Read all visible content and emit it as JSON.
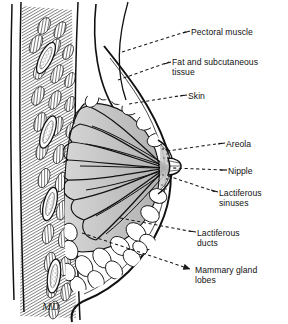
{
  "figure": {
    "signature": "MD",
    "colors": {
      "ink": "#111111",
      "gland_fill": "#bfbfbf",
      "gland_fill_light": "#d2d2d2",
      "background": "#ffffff",
      "leader": "#1a1a1a"
    }
  },
  "labels": [
    {
      "id": "pectoral-muscle",
      "text": "Pectoral muscle",
      "x": 191,
      "y": 27,
      "leader": {
        "x1": 122,
        "y1": 52,
        "x2": 188,
        "y2": 31,
        "style": "dashed"
      }
    },
    {
      "id": "fat-and-subcutaneous-tissue",
      "text": "Fat and subcutaneous\ntissue",
      "x": 172,
      "y": 57,
      "leader": {
        "x1": 118,
        "y1": 80,
        "x2": 169,
        "y2": 62,
        "style": "dashed"
      }
    },
    {
      "id": "skin",
      "text": "Skin",
      "x": 188,
      "y": 91,
      "leader": {
        "x1": 129,
        "y1": 104,
        "x2": 185,
        "y2": 95,
        "style": "dashed"
      }
    },
    {
      "id": "areola",
      "text": "Areola",
      "x": 226,
      "y": 139,
      "leader": {
        "x1": 167,
        "y1": 151,
        "x2": 223,
        "y2": 143,
        "style": "dashed"
      }
    },
    {
      "id": "nipple",
      "text": "Nipple",
      "x": 228,
      "y": 166,
      "leader": {
        "x1": 173,
        "y1": 168,
        "x2": 225,
        "y2": 170,
        "style": "dashed"
      }
    },
    {
      "id": "lactiferous-sinuses",
      "text": "Lactiferous\nsinuses",
      "x": 219,
      "y": 188,
      "leader": {
        "x1": 168,
        "y1": 176,
        "x2": 216,
        "y2": 192,
        "style": "dashed"
      }
    },
    {
      "id": "lactiferous-ducts",
      "text": "Lactiferous\nducts",
      "x": 197,
      "y": 228,
      "leader": {
        "x1": 120,
        "y1": 218,
        "x2": 194,
        "y2": 232,
        "style": "dashed"
      }
    },
    {
      "id": "mammary-gland-lobes",
      "text": "Mammary gland\nlobes",
      "x": 195,
      "y": 265,
      "leader": {
        "x1": 82,
        "y1": 233,
        "x2": 190,
        "y2": 269,
        "style": "dashed-arrow"
      }
    }
  ],
  "structures": [
    {
      "id": "rib",
      "name": "rib",
      "count": 4
    },
    {
      "id": "intercostal-muscle",
      "name": "intercostal and pectoral muscle bundles"
    },
    {
      "id": "chest-wall",
      "name": "chest wall"
    },
    {
      "id": "gland-lobes",
      "name": "mammary gland lobes (shaded)"
    },
    {
      "id": "fat-lobules",
      "name": "fat lobules"
    },
    {
      "id": "ducts",
      "name": "lactiferous ducts converging at nipple"
    },
    {
      "id": "nipple",
      "name": "nipple"
    },
    {
      "id": "areola",
      "name": "areola"
    },
    {
      "id": "skin-outline",
      "name": "skin outline"
    }
  ]
}
